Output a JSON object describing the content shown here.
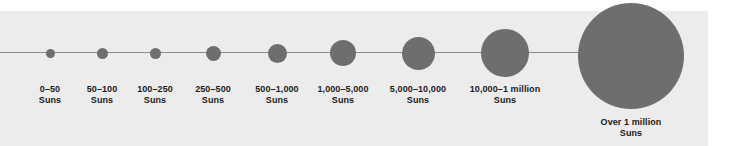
{
  "figure": {
    "background_color": "#ffffff",
    "panel_color": "#ececed",
    "node_color": "#6e6e6e",
    "axis_color": "#8a8a8a",
    "unit_label": "Suns"
  },
  "chart_data": {
    "type": "scatter",
    "title": "",
    "xlabel": "",
    "ylabel": "",
    "legend": "none",
    "grid": false,
    "orientation": "horizontal",
    "encoding": "circle area increases with mass range",
    "categories": [
      "0–50",
      "50–100",
      "100–250",
      "250–500",
      "500–1,000",
      "1,000–5,000",
      "5,000–10,000",
      "10,000–1 million",
      "Over 1 million"
    ],
    "values": [
      9,
      11,
      11,
      15,
      19,
      26,
      33,
      48,
      106
    ],
    "value_unit": "pixel diameter",
    "points": [
      {
        "label": "0–50",
        "unit": "Suns",
        "cx": 50,
        "cy": 53,
        "d": 9,
        "on_axis": true,
        "caption_cx": 50,
        "caption_top": 84
      },
      {
        "label": "50–100",
        "unit": "Suns",
        "cx": 102,
        "cy": 53,
        "d": 11,
        "on_axis": true,
        "caption_cx": 102,
        "caption_top": 84
      },
      {
        "label": "100–250",
        "unit": "Suns",
        "cx": 155,
        "cy": 53,
        "d": 11,
        "on_axis": true,
        "caption_cx": 155,
        "caption_top": 84
      },
      {
        "label": "250–500",
        "unit": "Suns",
        "cx": 213,
        "cy": 53,
        "d": 15,
        "on_axis": true,
        "caption_cx": 213,
        "caption_top": 84
      },
      {
        "label": "500–1,000",
        "unit": "Suns",
        "cx": 277,
        "cy": 53,
        "d": 19,
        "on_axis": true,
        "caption_cx": 277,
        "caption_top": 84
      },
      {
        "label": "1,000–5,000",
        "unit": "Suns",
        "cx": 343,
        "cy": 53,
        "d": 26,
        "on_axis": true,
        "caption_cx": 343,
        "caption_top": 84
      },
      {
        "label": "5,000–10,000",
        "unit": "Suns",
        "cx": 418,
        "cy": 53,
        "d": 33,
        "on_axis": true,
        "caption_cx": 418,
        "caption_top": 84
      },
      {
        "label": "10,000–1 million",
        "unit": "Suns",
        "cx": 505,
        "cy": 53,
        "d": 48,
        "on_axis": true,
        "caption_cx": 505,
        "caption_top": 84
      },
      {
        "label": "Over 1 million",
        "unit": "Suns",
        "cx": 631,
        "cy": 56,
        "d": 106,
        "on_axis": false,
        "caption_cx": 631,
        "caption_top": 117
      }
    ]
  }
}
